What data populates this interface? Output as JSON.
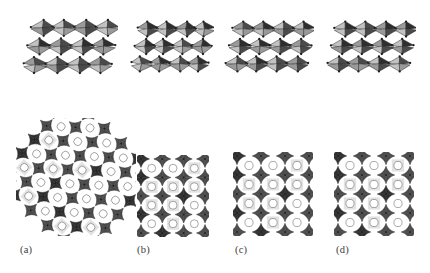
{
  "figure": {
    "kind": "crystal-structure-polyhedral-figure",
    "background_color": "#ffffff",
    "render_style": "grayscale shaded polyhedra",
    "rows": 2,
    "columns": 4,
    "row_descriptions": [
      "perspective view of corner-sharing octahedral framework",
      "projection down channel axis showing pores"
    ]
  },
  "palette": {
    "background": "#ffffff",
    "face_light": "#c2c2c2",
    "face_mid": "#9a9a9a",
    "face_dark": "#4a4a4a",
    "face_darkest": "#2e2e2e",
    "edge": "#2b2b2b",
    "vertex": "#1e1e1e",
    "label_text": "#3c3c3c"
  },
  "panels": [
    {
      "id": "a",
      "label": "(a)",
      "label_x": 20,
      "label_y": 245,
      "top": {
        "name": "top-view-a",
        "x": 22,
        "y": 14,
        "width": 96,
        "height": 66,
        "cols": 4,
        "rows": 3,
        "tilt_deg": 16,
        "contrast": "high",
        "description": "heavily tilted corner-sharing octahedra, dense packing"
      },
      "bottom": {
        "name": "bottom-view-a",
        "x": 16,
        "y": 118,
        "width": 120,
        "height": 118,
        "cols": 5,
        "rows": 6,
        "rotate_deg": 42,
        "pore_count": 18,
        "description": "large diamond-oriented framework with circular channels"
      }
    },
    {
      "id": "b",
      "label": "(b)",
      "label_x": 137,
      "label_y": 245,
      "top": {
        "name": "top-view-b",
        "x": 130,
        "y": 16,
        "width": 84,
        "height": 62,
        "cols": 4,
        "rows": 3,
        "tilt_deg": 22,
        "contrast": "high",
        "description": "tilted octahedra with open interstitial gaps"
      },
      "bottom": {
        "name": "bottom-view-b",
        "x": 137,
        "y": 155,
        "width": 72,
        "height": 82,
        "cols": 3,
        "rows": 4,
        "rotate_deg": 0,
        "pore_count": 12,
        "description": "narrow slab projection with oval channels"
      }
    },
    {
      "id": "c",
      "label": "(c)",
      "label_x": 235,
      "label_y": 245,
      "top": {
        "name": "top-view-c",
        "x": 224,
        "y": 16,
        "width": 90,
        "height": 62,
        "cols": 4,
        "rows": 3,
        "tilt_deg": 10,
        "contrast": "medium",
        "description": "regular corner-sharing octahedral array, slight tilt"
      },
      "bottom": {
        "name": "bottom-view-c",
        "x": 233,
        "y": 152,
        "width": 80,
        "height": 84,
        "cols": 3,
        "rows": 4,
        "rotate_deg": 0,
        "pore_count": 12,
        "description": "square-channel projection with round pores"
      }
    },
    {
      "id": "d",
      "label": "(d)",
      "label_x": 336,
      "label_y": 245,
      "top": {
        "name": "top-view-d",
        "x": 326,
        "y": 16,
        "width": 90,
        "height": 62,
        "cols": 4,
        "rows": 3,
        "tilt_deg": 6,
        "contrast": "medium-high",
        "description": "near-untilted octahedral framework"
      },
      "bottom": {
        "name": "bottom-view-d",
        "x": 334,
        "y": 152,
        "width": 80,
        "height": 84,
        "cols": 3,
        "rows": 4,
        "rotate_deg": 0,
        "pore_count": 12,
        "description": "square-channel projection, slightly rotated pores"
      }
    }
  ]
}
